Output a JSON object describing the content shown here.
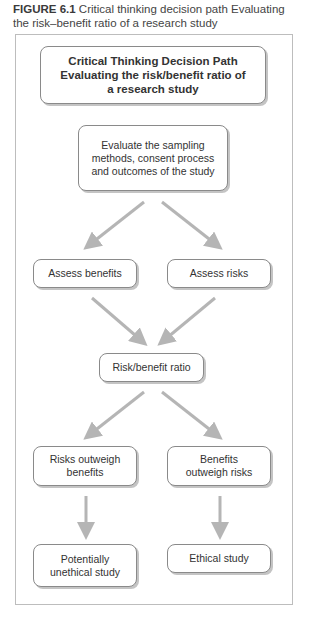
{
  "caption": {
    "figure_label": "FIGURE 6.1",
    "text": "Critical thinking decision path  Evaluating the risk–benefit ratio of a research study"
  },
  "diagram": {
    "title_box": {
      "line1": "Critical Thinking Decision Path",
      "line2": "Evaluating the risk/benefit ratio of",
      "line3": "a research study"
    },
    "nodes": {
      "evaluate": "Evaluate the sampling methods, consent process and outcomes of the study",
      "assess_benefits": "Assess benefits",
      "assess_risks": "Assess risks",
      "ratio": "Risk/benefit ratio",
      "risks_outweigh": "Risks outweigh benefits",
      "benefits_outweigh": "Benefits outweigh risks",
      "unethical": "Potentially unethical study",
      "ethical": "Ethical study"
    },
    "edges": [
      {
        "from": "evaluate",
        "to": "assess_benefits"
      },
      {
        "from": "evaluate",
        "to": "assess_risks"
      },
      {
        "from": "assess_benefits",
        "to": "ratio"
      },
      {
        "from": "assess_risks",
        "to": "ratio"
      },
      {
        "from": "ratio",
        "to": "risks_outweigh"
      },
      {
        "from": "ratio",
        "to": "benefits_outweigh"
      },
      {
        "from": "risks_outweigh",
        "to": "unethical"
      },
      {
        "from": "benefits_outweigh",
        "to": "ethical"
      }
    ],
    "colors": {
      "arrow": "#b5b5b5",
      "box_border": "#8a8a8a",
      "frame_border": "#bdbdbd"
    }
  }
}
